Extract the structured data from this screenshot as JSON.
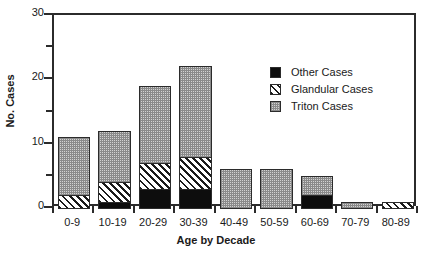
{
  "chart_data": {
    "type": "bar",
    "subtype": "stacked-vertical",
    "title": "",
    "xlabel": "Age by Decade",
    "ylabel": "No. Cases",
    "categories": [
      "0-9",
      "10-19",
      "20-29",
      "30-39",
      "40-49",
      "50-59",
      "60-69",
      "70-79",
      "80-89"
    ],
    "series": [
      {
        "name": "Other Cases",
        "fill": "solid-black",
        "color": "#0d0d0d",
        "values": [
          0,
          1,
          3,
          3,
          0,
          0,
          2,
          0,
          0
        ]
      },
      {
        "name": "Glandular Cases",
        "fill": "diagonal-hatch",
        "color": "#1a1a1a",
        "values": [
          2,
          3,
          4,
          5,
          0,
          0,
          0,
          0,
          1
        ]
      },
      {
        "name": "Triton Cases",
        "fill": "stipple-gray",
        "color": "#d2d2d2",
        "values": [
          9,
          8,
          12,
          14,
          6,
          6,
          3,
          1,
          0
        ]
      }
    ],
    "totals": [
      11,
      12,
      19,
      22,
      6,
      6,
      5,
      1,
      1
    ],
    "ylim": [
      0,
      30
    ],
    "yticks": [
      0,
      10,
      20,
      30
    ],
    "ytick_labels": [
      "0",
      "10",
      "20",
      "30"
    ],
    "yminor_ticks": [
      5,
      15,
      25
    ],
    "grid": false,
    "legend_position": "inside-upper-right"
  },
  "legend": {
    "entries": [
      {
        "label": "Other Cases",
        "swatch": "solid-black-swatch"
      },
      {
        "label": "Glandular Cases",
        "swatch": "diagonal-hatch-swatch"
      },
      {
        "label": "Triton Cases",
        "swatch": "stipple-gray-swatch"
      }
    ]
  }
}
